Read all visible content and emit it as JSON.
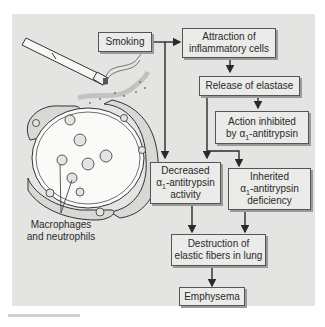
{
  "diagram": {
    "nodes": {
      "smoking": {
        "label": "Smoking"
      },
      "attraction": {
        "line1": "Attraction of",
        "line2": "inflammatory cells"
      },
      "elastase": {
        "label": "Release of elastase"
      },
      "inhibited": {
        "line1": "Action inhibited",
        "line2_pre": "by ",
        "alpha": "α",
        "sub": "1",
        "line2_post": "-antitrypsin"
      },
      "decreased": {
        "line1": "Decreased",
        "alpha": "α",
        "sub": "1",
        "line2_post": "-antitrypsin",
        "line3": "activity"
      },
      "inherited": {
        "line1": "Inherited",
        "alpha": "α",
        "sub": "1",
        "line2_post": "-antitrypsin",
        "line3": "deficiency"
      },
      "destruction": {
        "line1": "Destruction of",
        "line2": "elastic fibers in lung"
      },
      "emphysema": {
        "label": "Emphysema"
      }
    },
    "illustration": {
      "items": [
        "cigarette",
        "smoke",
        "alveolus"
      ],
      "callout_line1": "Macrophages",
      "callout_line2": "and neutrophils"
    },
    "edges": [
      [
        "smoking",
        "attraction"
      ],
      [
        "smoking",
        "decreased"
      ],
      [
        "attraction",
        "elastase"
      ],
      [
        "elastase",
        "inhibited"
      ],
      [
        "elastase",
        "decreased"
      ],
      [
        "elastase",
        "inherited"
      ],
      [
        "decreased",
        "destruction"
      ],
      [
        "inherited",
        "destruction"
      ],
      [
        "destruction",
        "emphysema"
      ]
    ],
    "colors": {
      "panel": "#e4e4e2",
      "box": "#ebebe9",
      "line": "#2a2a2a"
    }
  }
}
